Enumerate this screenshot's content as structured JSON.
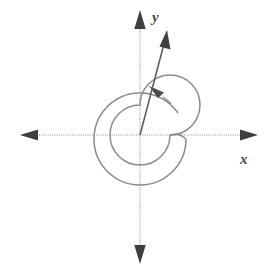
{
  "figure": {
    "kind": "coordinate-plane-angle-diagram",
    "background_color": "#ffffff",
    "stroke_color": "#6e6e6e",
    "dark_stroke_color": "#4a4a4a",
    "width": 275,
    "height": 277
  },
  "axes": {
    "origin": {
      "x": 140,
      "y": 135
    },
    "x_axis": {
      "label": "x",
      "label_position": {
        "x": 243,
        "y": 161
      },
      "start": {
        "x": 20,
        "y": 135
      },
      "end": {
        "x": 258,
        "y": 135
      },
      "arrow_left": true,
      "arrow_right": true
    },
    "y_axis": {
      "label": "y",
      "label_position": {
        "x": 152,
        "y": 20
      },
      "start": {
        "x": 140,
        "y": 10
      },
      "end": {
        "x": 140,
        "y": 262
      },
      "arrow_up": true,
      "arrow_down": true
    }
  },
  "angle": {
    "inner_arc_radius": 30,
    "outer_arc_radius": 46,
    "rotation_direction": "counterclockwise",
    "revolutions": "more than one",
    "terminal_ray": {
      "from": {
        "x": 140,
        "y": 135
      },
      "to": {
        "x": 166,
        "y": 34
      },
      "arrow": true
    },
    "arc_arrow_tip": {
      "x": 152,
      "y": 89
    }
  }
}
